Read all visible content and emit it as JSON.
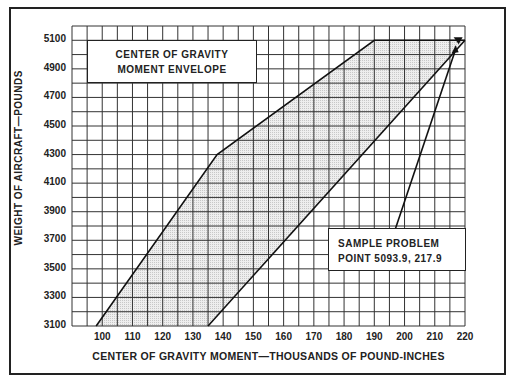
{
  "chart_data": {
    "type": "area",
    "title": "CENTER OF GRAVITY MOMENT ENVELOPE",
    "xlabel": "CENTER OF GRAVITY MOMENT—THOUSANDS OF POUND-INCHES",
    "ylabel": "WEIGHT OF AIRCRAFT—POUNDS",
    "x_ticks": [
      100,
      110,
      120,
      130,
      140,
      150,
      160,
      170,
      180,
      190,
      200,
      210,
      220
    ],
    "y_ticks": [
      3100,
      3300,
      3500,
      3700,
      3900,
      4100,
      4300,
      4500,
      4700,
      4900,
      5100
    ],
    "xlim": [
      90,
      220
    ],
    "ylim": [
      3100,
      5200
    ],
    "grid": true,
    "envelope_polygon": [
      {
        "x": 98,
        "y": 3100
      },
      {
        "x": 138,
        "y": 4300
      },
      {
        "x": 190,
        "y": 5100
      },
      {
        "x": 220,
        "y": 5100
      },
      {
        "x": 135,
        "y": 3100
      }
    ],
    "sample_point": {
      "x": 217.9,
      "y": 5093.9
    },
    "annotation": {
      "line1": "SAMPLE PROBLEM",
      "line2": "POINT  5093.9, 217.9"
    }
  },
  "labels": {
    "title_line1": "CENTER OF GRAVITY",
    "title_line2": "MOMENT ENVELOPE",
    "sample_line1": "SAMPLE PROBLEM",
    "sample_line2": "POINT  5093.9, 217.9",
    "xlabel": "CENTER OF GRAVITY MOMENT—THOUSANDS OF POUND-INCHES",
    "ylabel": "WEIGHT OF AIRCRAFT—POUNDS"
  },
  "ticks": {
    "y": [
      "5100",
      "4900",
      "4700",
      "4500",
      "4300",
      "4100",
      "3900",
      "3700",
      "3500",
      "3300",
      "3100"
    ],
    "x": [
      "100",
      "110",
      "120",
      "130",
      "140",
      "150",
      "160",
      "170",
      "180",
      "190",
      "200",
      "210",
      "220"
    ]
  }
}
